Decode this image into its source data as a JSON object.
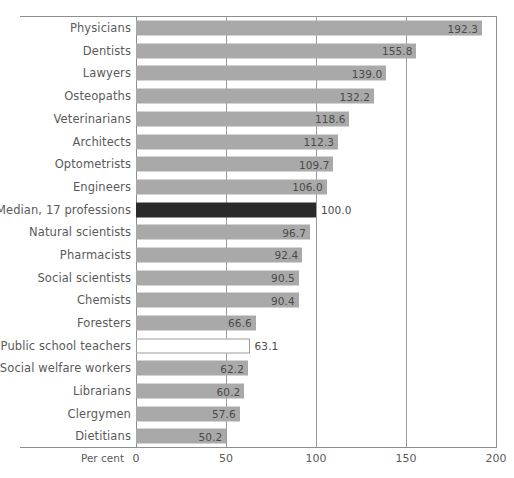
{
  "chart_data": {
    "type": "bar",
    "orientation": "horizontal",
    "title": "",
    "xlabel": "Per cent",
    "ylabel": "",
    "xlim": [
      0,
      200
    ],
    "xticks": [
      0,
      50,
      100,
      150,
      200
    ],
    "xtick_labels": [
      "0",
      "50",
      "100",
      "150",
      "200"
    ],
    "grid": true,
    "legend": "none",
    "categories": [
      "Physicians",
      "Dentists",
      "Lawyers",
      "Osteopaths",
      "Veterinarians",
      "Architects",
      "Optometrists",
      "Engineers",
      "Median, 17 professions",
      "Natural scientists",
      "Pharmacists",
      "Social scientists",
      "Chemists",
      "Foresters",
      "Public school teachers",
      "Social welfare workers",
      "Librarians",
      "Clergymen",
      "Dietitians"
    ],
    "values": [
      192.3,
      155.8,
      139.0,
      132.2,
      118.6,
      112.3,
      109.7,
      106.0,
      100.0,
      96.7,
      92.4,
      90.5,
      90.4,
      66.6,
      63.1,
      62.2,
      60.2,
      57.6,
      50.2
    ],
    "value_labels": [
      "192.3",
      "155.8",
      "139.0",
      "132.2",
      "118.6",
      "112.3",
      "109.7",
      "106.0",
      "100.0",
      "96.7",
      "92.4",
      "90.5",
      "90.4",
      "66.6",
      "63.1",
      "62.2",
      "60.2",
      "57.6",
      "50.2"
    ],
    "bar_styles": [
      "filled",
      "filled",
      "filled",
      "filled",
      "filled",
      "filled",
      "filled",
      "filled",
      "median",
      "filled",
      "filled",
      "filled",
      "filled",
      "filled",
      "hollow",
      "filled",
      "filled",
      "filled",
      "filled"
    ],
    "label_placement": [
      "inside",
      "inside",
      "inside",
      "inside",
      "inside",
      "inside",
      "inside",
      "inside",
      "outside",
      "inside",
      "inside",
      "inside",
      "inside",
      "inside",
      "outside",
      "inside",
      "inside",
      "inside",
      "inside"
    ],
    "colors": {
      "bar_fill": "#a9a9a9",
      "median_fill": "#2a2a2a",
      "hollow_fill": "#ffffff",
      "hollow_stroke": "#9c9c9c",
      "axis": "#8e8e8e",
      "grid": "#9a9a9a",
      "text": "#5a5a5a",
      "background": "#ffffff"
    }
  }
}
